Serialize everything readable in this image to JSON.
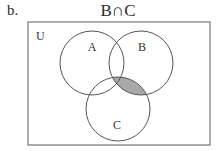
{
  "problem_label": "b.",
  "title": "B∩C",
  "universe_label": "U",
  "sets": [
    {
      "name": "A",
      "cx": 92,
      "cy": 63,
      "r": 32,
      "label_x": 92,
      "label_y": 47
    },
    {
      "name": "B",
      "cx": 141,
      "cy": 63,
      "r": 32,
      "label_x": 142,
      "label_y": 47
    },
    {
      "name": "C",
      "cx": 118,
      "cy": 109,
      "r": 32,
      "label_x": 117,
      "label_y": 125
    }
  ],
  "shaded_region": "B∩C",
  "colors": {
    "stroke": "#555555",
    "shade": "#a8a8a8",
    "rect": "#777777"
  }
}
